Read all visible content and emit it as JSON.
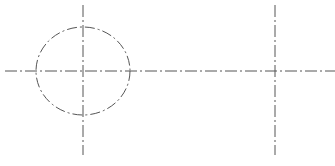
{
  "drawing": {
    "background": "#ffffff",
    "line_color": "#555555",
    "circle": {
      "cx": 83,
      "cy": 71,
      "rx": 47,
      "ry": 44,
      "line_style": "dash-dot"
    },
    "centerlines": [
      {
        "id": "horizontal-main",
        "x1": 5,
        "y1": 71,
        "x2": 335,
        "y2": 71
      },
      {
        "id": "vertical-left",
        "x1": 83,
        "y1": 5,
        "x2": 83,
        "y2": 155
      },
      {
        "id": "vertical-right",
        "x1": 275,
        "y1": 5,
        "x2": 275,
        "y2": 155
      }
    ],
    "intersections": [
      {
        "x": 83,
        "y": 71
      },
      {
        "x": 275,
        "y": 71
      }
    ]
  }
}
